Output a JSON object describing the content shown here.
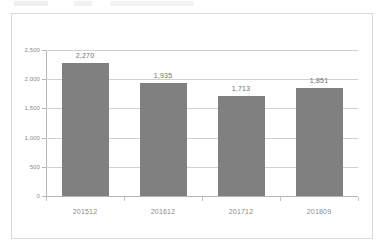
{
  "chart_data": {
    "type": "bar",
    "title": "",
    "subtitle": "",
    "xlabel": "",
    "ylabel": "",
    "categories": [
      "201512",
      "201612",
      "201712",
      "201809"
    ],
    "values": [
      2270,
      1935,
      1713,
      1851
    ],
    "value_labels": [
      "2,270",
      "1,935",
      "1,713",
      "1,851"
    ],
    "series": [
      {
        "name": "",
        "values": [
          2270,
          1935,
          1713,
          1851
        ]
      }
    ],
    "ylim": [
      0,
      2500
    ],
    "y_tick_values": [
      0,
      500,
      1000,
      1500,
      2000,
      2500
    ],
    "y_tick_labels": [
      "0",
      "500",
      "1,000",
      "1,500",
      "2,000",
      "2,500"
    ],
    "grid": true,
    "legend": false,
    "legend_position": "none",
    "colors": {
      "bar_fill": "#808080",
      "gridline": "#d0d0d0",
      "axis_line": "#b5b5b5",
      "frame_border": "#d9d9d9",
      "tick_label_text": "#8a8a8a",
      "data_label_text": "#6f6f6f",
      "background": "#ffffff"
    }
  }
}
